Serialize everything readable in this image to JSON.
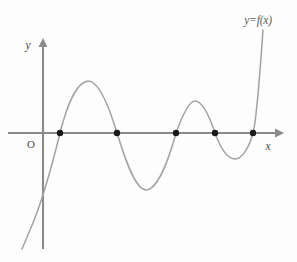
{
  "figure": {
    "background_color": "#fdfdfd",
    "width": 297,
    "height": 262
  },
  "labels": {
    "y_axis": "y",
    "x_axis": "x",
    "origin": "O",
    "curve": "y=f(x)"
  },
  "colors": {
    "axis": "#8a8a8a",
    "curve": "#a3a3a3",
    "dot": "#1a1a1a",
    "text": "#4a4a4a",
    "curve_label_text": "#5a5a5a"
  },
  "chart_data": {
    "type": "line",
    "title": "y=f(x)",
    "xlabel": "x",
    "ylabel": "y",
    "grid": false,
    "legend": "none",
    "annotations": [
      "y=f(x)",
      "O"
    ],
    "axes": {
      "x_axis_y_px": 133,
      "y_axis_x_px": 43,
      "x_axis_start_px": 8,
      "x_axis_end_px": 281,
      "y_axis_top_px": 40,
      "y_axis_bottom_px": 249
    },
    "roots": [
      {
        "label": "x1",
        "x_px": 60,
        "y_px": 133
      },
      {
        "label": "x2",
        "x_px": 117,
        "y_px": 133
      },
      {
        "label": "x3",
        "x_px": 176,
        "y_px": 133
      },
      {
        "label": "x4",
        "x_px": 215,
        "y_px": 133
      },
      {
        "label": "x5",
        "x_px": 253,
        "y_px": 133
      }
    ],
    "root_count": 5,
    "extrema": [
      {
        "kind": "maximum",
        "x_px": 88,
        "y_px": 81
      },
      {
        "kind": "minimum",
        "x_px": 146,
        "y_px": 190
      },
      {
        "kind": "maximum",
        "x_px": 195,
        "y_px": 101
      },
      {
        "kind": "minimum",
        "x_px": 235,
        "y_px": 159
      }
    ],
    "curve_path": "M 22,249 L 30,230 C 38,212 48,182 60,133 C 68,101 78,82 88,81 C 98,81 108,103 117,133 C 128,169 137,190 146,190 C 156,190 167,166 176,133 C 184,111 190,101 195,101 C 201,101 208,112 215,133 C 222,152 228,159 235,159 C 242,159 249,148 253,133 C 257,118 260,72 263,30",
    "tail_left": {
      "x_px": 22,
      "y_px": 249,
      "direction": "down-left"
    },
    "tail_right": {
      "x_px": 263,
      "y_px": 30,
      "direction": "up-right"
    }
  }
}
